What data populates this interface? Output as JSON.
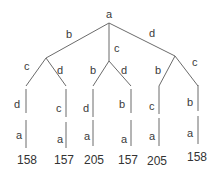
{
  "diagram": {
    "type": "tree",
    "colors": {
      "edge": "#6b6b6b",
      "text": "#3a3a3a"
    },
    "root": {
      "label": "a"
    },
    "branches": [
      {
        "edge_label": "b",
        "children": [
          {
            "edge_label": "c",
            "path": [
              "d",
              "a"
            ],
            "leaf_value": "158"
          },
          {
            "edge_label": "d",
            "path": [
              "c",
              "a"
            ],
            "leaf_value": "157"
          }
        ]
      },
      {
        "edge_label": "c",
        "children": [
          {
            "edge_label": "b",
            "path": [
              "d",
              "a"
            ],
            "leaf_value": "205"
          },
          {
            "edge_label": "d",
            "path": [
              "b",
              "a"
            ],
            "leaf_value": "157"
          }
        ]
      },
      {
        "edge_label": "d",
        "children": [
          {
            "edge_label": "b",
            "path": [
              "c",
              "a"
            ],
            "leaf_value": "205"
          },
          {
            "edge_label": "c",
            "path": [
              "b",
              "a"
            ],
            "leaf_value": "158"
          }
        ]
      }
    ]
  }
}
